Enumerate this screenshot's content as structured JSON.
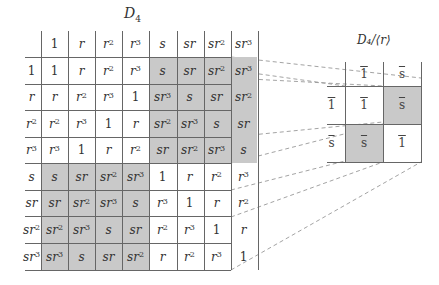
{
  "main_table": {
    "title": "D",
    "title_sub": "4",
    "header_columns": [
      {
        "base": "1",
        "exp": ""
      },
      {
        "base": "r",
        "exp": ""
      },
      {
        "base": "r",
        "exp": "2"
      },
      {
        "base": "r",
        "exp": "3"
      },
      {
        "base": "s",
        "exp": ""
      },
      {
        "base": "sr",
        "exp": ""
      },
      {
        "base": "sr",
        "exp": "2"
      },
      {
        "base": "sr",
        "exp": "3"
      }
    ],
    "rows": [
      {
        "label": {
          "base": "1",
          "exp": ""
        },
        "cells": [
          [
            "1",
            ""
          ],
          [
            "r",
            ""
          ],
          [
            "r",
            "2"
          ],
          [
            "r",
            "3"
          ],
          [
            "s",
            ""
          ],
          [
            "sr",
            ""
          ],
          [
            "sr",
            "2"
          ],
          [
            "sr",
            "3"
          ]
        ]
      },
      {
        "label": {
          "base": "r",
          "exp": ""
        },
        "cells": [
          [
            "r",
            ""
          ],
          [
            "r",
            "2"
          ],
          [
            "r",
            "3"
          ],
          [
            "1",
            ""
          ],
          [
            "sr",
            "3"
          ],
          [
            "s",
            ""
          ],
          [
            "sr",
            ""
          ],
          [
            "sr",
            "2"
          ]
        ]
      },
      {
        "label": {
          "base": "r",
          "exp": "2"
        },
        "cells": [
          [
            "r",
            "2"
          ],
          [
            "r",
            "3"
          ],
          [
            "1",
            ""
          ],
          [
            "r",
            ""
          ],
          [
            "sr",
            "2"
          ],
          [
            "sr",
            "3"
          ],
          [
            "s",
            ""
          ],
          [
            "sr",
            ""
          ]
        ]
      },
      {
        "label": {
          "base": "r",
          "exp": "3"
        },
        "cells": [
          [
            "r",
            "3"
          ],
          [
            "1",
            ""
          ],
          [
            "r",
            ""
          ],
          [
            "r",
            "2"
          ],
          [
            "sr",
            ""
          ],
          [
            "sr",
            "2"
          ],
          [
            "sr",
            "3"
          ],
          [
            "s",
            ""
          ]
        ]
      },
      {
        "label": {
          "base": "s",
          "exp": ""
        },
        "cells": [
          [
            "s",
            ""
          ],
          [
            "sr",
            ""
          ],
          [
            "sr",
            "2"
          ],
          [
            "sr",
            "3"
          ],
          [
            "1",
            ""
          ],
          [
            "r",
            ""
          ],
          [
            "r",
            "2"
          ],
          [
            "r",
            "3"
          ]
        ]
      },
      {
        "label": {
          "base": "sr",
          "exp": ""
        },
        "cells": [
          [
            "sr",
            ""
          ],
          [
            "sr",
            "2"
          ],
          [
            "sr",
            "3"
          ],
          [
            "s",
            ""
          ],
          [
            "r",
            "3"
          ],
          [
            "1",
            ""
          ],
          [
            "r",
            ""
          ],
          [
            "r",
            "2"
          ]
        ]
      },
      {
        "label": {
          "base": "sr",
          "exp": "2"
        },
        "cells": [
          [
            "sr",
            "2"
          ],
          [
            "sr",
            "3"
          ],
          [
            "s",
            ""
          ],
          [
            "sr",
            ""
          ],
          [
            "r",
            "2"
          ],
          [
            "r",
            "3"
          ],
          [
            "1",
            ""
          ],
          [
            "r",
            ""
          ]
        ]
      },
      {
        "label": {
          "base": "sr",
          "exp": "3"
        },
        "cells": [
          [
            "sr",
            "3"
          ],
          [
            "s",
            ""
          ],
          [
            "sr",
            ""
          ],
          [
            "sr",
            "2"
          ],
          [
            "r",
            ""
          ],
          [
            "r",
            "2"
          ],
          [
            "r",
            "3"
          ],
          [
            "1",
            ""
          ]
        ]
      }
    ],
    "shaded_quadrants": [
      "top-right",
      "bottom-left"
    ],
    "shade_color": "#c9c9c9"
  },
  "quotient_table": {
    "title": "D₄/⟨r⟩",
    "header_columns": [
      "1",
      "s"
    ],
    "rows": [
      {
        "label": "1",
        "cells": [
          "1",
          "s"
        ]
      },
      {
        "label": "s",
        "cells": [
          "s",
          "1"
        ]
      }
    ],
    "shaded_cells": [
      [
        0,
        1
      ],
      [
        1,
        0
      ]
    ]
  },
  "colors": {
    "grid": "#666666",
    "shade": "#c9c9c9",
    "dash": "#999999",
    "text": "#333333"
  }
}
